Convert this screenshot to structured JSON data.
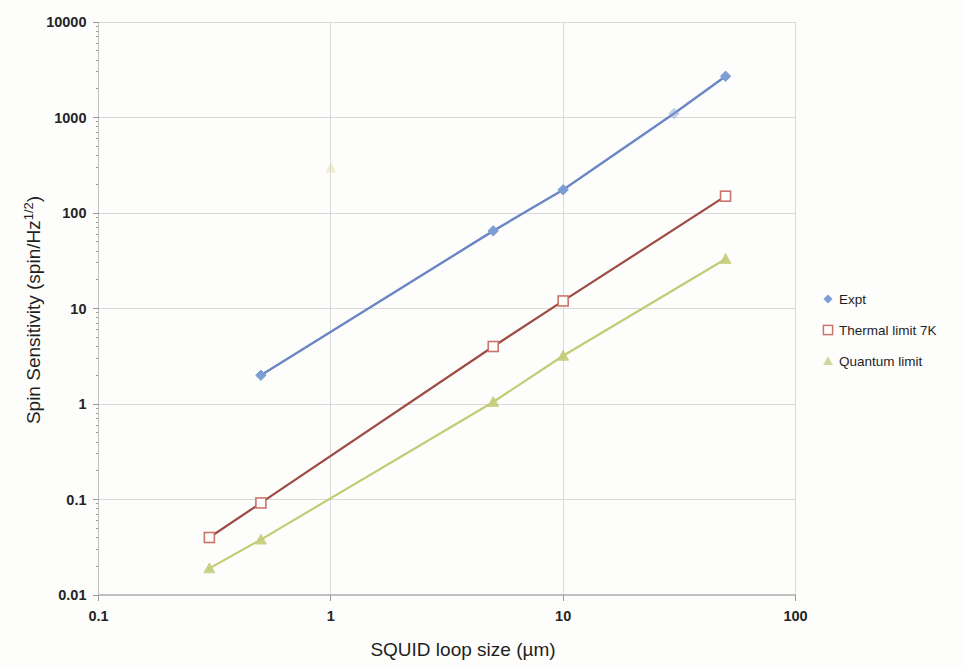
{
  "chart_data": {
    "type": "line",
    "title": "",
    "xlabel": "SQUID loop size (µm)",
    "ylabel": "Spin Sensitivity (spin/Hz¹ᐟ²)",
    "ylabel_base": "Spin Sensitivity (spin/Hz",
    "ylabel_sup": "1/2",
    "ylabel_tail": ")",
    "xscale": "log",
    "yscale": "log",
    "xlim": [
      0.1,
      100
    ],
    "ylim": [
      0.01,
      10000
    ],
    "xticks": [
      0.1,
      1,
      10,
      100
    ],
    "xtick_labels": [
      "0.1",
      "1",
      "10",
      "100"
    ],
    "yticks": [
      0.01,
      0.1,
      1,
      10,
      100,
      1000,
      10000
    ],
    "ytick_labels": [
      "0.01",
      "0.1",
      "1",
      "10",
      "100",
      "1000",
      "10000"
    ],
    "grid": true,
    "legend_position": "right",
    "series": [
      {
        "name": "Expt",
        "color": "#7d9ed4",
        "line_color": "#6b86c4",
        "marker": "diamond",
        "x": [
          0.5,
          5,
          10,
          30,
          50
        ],
        "y": [
          2.0,
          65,
          175,
          1100,
          2700
        ]
      },
      {
        "name": "Thermal limit 7K",
        "color": "#c8756b",
        "line_color": "#9e4b42",
        "marker": "open-square",
        "x": [
          0.3,
          0.5,
          5,
          10,
          50
        ],
        "y": [
          0.04,
          0.092,
          4.0,
          12.0,
          150
        ]
      },
      {
        "name": "Quantum limit",
        "color": "#c4cd7a",
        "line_color": "#c0c96e",
        "marker": "triangle",
        "x": [
          0.3,
          0.5,
          5,
          10,
          50
        ],
        "y": [
          0.019,
          0.038,
          1.05,
          3.2,
          33
        ]
      }
    ],
    "stray_mark": {
      "x": 1.0,
      "y": 300,
      "color": "#e4dca8"
    }
  },
  "legend": {
    "items": [
      {
        "label": "Expt",
        "marker": "diamond",
        "color": "#7d9ed4"
      },
      {
        "label": "Thermal limit 7K",
        "marker": "open-square",
        "color": "#c8756b"
      },
      {
        "label": "Quantum limit",
        "marker": "triangle",
        "color": "#c8cd8c"
      }
    ]
  }
}
